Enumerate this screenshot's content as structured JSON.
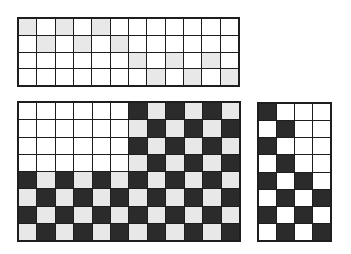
{
  "colors": {
    "white": "#ffffff",
    "light": "#e8e8e8",
    "dark": "#2b2b2b",
    "line": "#1e1e1e"
  },
  "grids": [
    {
      "id": "grid-top",
      "cols": 12,
      "rows": 4,
      "cells": [
        [
          "L",
          "W",
          "L",
          "W",
          "L",
          "W",
          "W",
          "W",
          "W",
          "W",
          "W",
          "W"
        ],
        [
          "W",
          "L",
          "W",
          "L",
          "W",
          "L",
          "W",
          "W",
          "W",
          "W",
          "W",
          "W"
        ],
        [
          "W",
          "W",
          "W",
          "W",
          "W",
          "W",
          "L",
          "W",
          "L",
          "W",
          "L",
          "W"
        ],
        [
          "W",
          "W",
          "W",
          "W",
          "W",
          "W",
          "W",
          "L",
          "W",
          "L",
          "W",
          "L"
        ]
      ]
    },
    {
      "id": "grid-bottom-left",
      "cols": 12,
      "rows": 8,
      "cells": [
        [
          "W",
          "W",
          "W",
          "W",
          "W",
          "W",
          "D",
          "L",
          "D",
          "L",
          "D",
          "L"
        ],
        [
          "W",
          "W",
          "W",
          "W",
          "W",
          "W",
          "L",
          "D",
          "L",
          "D",
          "L",
          "D"
        ],
        [
          "W",
          "W",
          "W",
          "W",
          "W",
          "W",
          "D",
          "L",
          "D",
          "L",
          "D",
          "L"
        ],
        [
          "W",
          "W",
          "W",
          "W",
          "W",
          "W",
          "L",
          "D",
          "L",
          "D",
          "L",
          "D"
        ],
        [
          "D",
          "L",
          "D",
          "L",
          "D",
          "L",
          "D",
          "L",
          "D",
          "L",
          "D",
          "L"
        ],
        [
          "L",
          "D",
          "L",
          "D",
          "L",
          "D",
          "L",
          "D",
          "L",
          "D",
          "L",
          "D"
        ],
        [
          "D",
          "L",
          "D",
          "L",
          "D",
          "L",
          "D",
          "L",
          "D",
          "L",
          "D",
          "L"
        ],
        [
          "L",
          "D",
          "L",
          "D",
          "L",
          "D",
          "L",
          "D",
          "L",
          "D",
          "L",
          "D"
        ]
      ]
    },
    {
      "id": "grid-bottom-right",
      "cols": 4,
      "rows": 8,
      "cells": [
        [
          "D",
          "W",
          "W",
          "W"
        ],
        [
          "W",
          "D",
          "W",
          "W"
        ],
        [
          "D",
          "W",
          "W",
          "W"
        ],
        [
          "W",
          "D",
          "W",
          "W"
        ],
        [
          "D",
          "W",
          "D",
          "W"
        ],
        [
          "W",
          "D",
          "W",
          "D"
        ],
        [
          "D",
          "W",
          "D",
          "W"
        ],
        [
          "W",
          "D",
          "W",
          "D"
        ]
      ]
    }
  ]
}
